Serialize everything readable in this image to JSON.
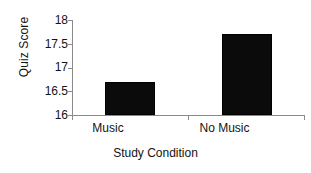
{
  "chart_data": {
    "type": "bar",
    "title": "",
    "categories": [
      "Music",
      "No Music"
    ],
    "values": [
      16.7,
      17.7
    ],
    "series": [
      {
        "name": "Quiz Score",
        "values": [
          16.7,
          17.7
        ]
      }
    ],
    "xlabel": "Study Condition",
    "ylabel": "Quiz Score",
    "ylim": [
      16,
      18
    ],
    "yticks": [
      "18",
      "17.5",
      "17",
      "16.5",
      "16"
    ],
    "ytick_values": [
      18,
      17.5,
      17,
      16.5,
      16
    ],
    "grid": false,
    "legend": false,
    "bar_color": "#000000",
    "axis_color": "#8a8a8a",
    "text_color": "#141414",
    "background": "#ffffff"
  }
}
